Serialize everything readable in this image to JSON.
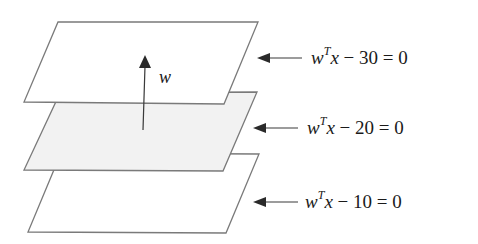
{
  "diagram": {
    "planes": [
      {
        "id": "top",
        "equation": {
          "var": "w",
          "sup": "T",
          "x": "x",
          "rest": " − 30 = 0"
        },
        "fill": "#ffffff"
      },
      {
        "id": "middle",
        "equation": {
          "var": "w",
          "sup": "T",
          "x": "x",
          "rest": " − 20 = 0"
        },
        "fill": "#f2f2f2"
      },
      {
        "id": "bottom",
        "equation": {
          "var": "w",
          "sup": "T",
          "x": "x",
          "rest": " − 10 = 0"
        },
        "fill": "#ffffff"
      }
    ],
    "normal_vector_label": "w",
    "colors": {
      "stroke": "#7a7a7a",
      "arrow": "#2a2a2a",
      "text": "#1a1a1a"
    }
  }
}
